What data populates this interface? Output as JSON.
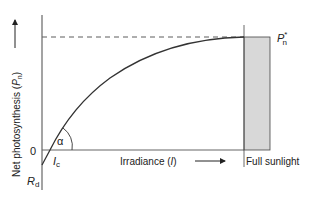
{
  "diagram": {
    "type": "light-response-curve",
    "y_axis": {
      "label": "Net photosynthesis (",
      "symbol": "P",
      "subscript": "n",
      "close": ")",
      "zero_label": "0",
      "arrow": "up-arrow"
    },
    "x_axis": {
      "label": "Irradiance (",
      "symbol": "I",
      "close": ")",
      "arrow": "right-arrow"
    },
    "labels": {
      "compensation_point": {
        "symbol": "I",
        "subscript": "c"
      },
      "dark_respiration": {
        "symbol": "R",
        "subscript": "d"
      },
      "max_rate": {
        "symbol": "P",
        "subscript": "n",
        "superscript": "*"
      },
      "angle": "α",
      "full_sunlight": "Full sunlight"
    },
    "colors": {
      "line": "#333333",
      "axis": "#555555",
      "shade": "#d8d8d8",
      "text": "#222222"
    }
  }
}
